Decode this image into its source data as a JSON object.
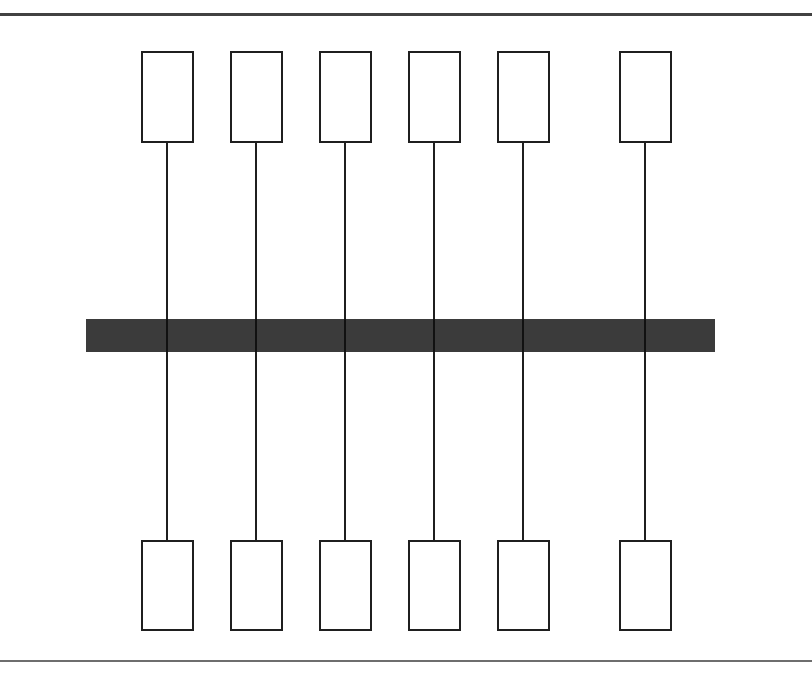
{
  "figure": {
    "title": "",
    "top_text_remnant": "",
    "background_color": "#ffffff"
  },
  "rules": {
    "top": {
      "name": "top-rule",
      "y": 13,
      "height": 3,
      "color": "#414141"
    },
    "bottom": {
      "name": "bottom-rule",
      "y": 660,
      "height": 2,
      "color": "#6e6e6e"
    }
  },
  "chart_data": {
    "type": "diagram",
    "title": "",
    "xlabel": "",
    "ylabel": "",
    "bar": {
      "label": "",
      "x": 86,
      "y": 319,
      "width": 629,
      "height": 33,
      "color": "#3b3b3b"
    },
    "columns": [
      {
        "index": 1,
        "center_x": 167
      },
      {
        "index": 2,
        "center_x": 256
      },
      {
        "index": 3,
        "center_x": 345
      },
      {
        "index": 4,
        "center_x": 434
      },
      {
        "index": 5,
        "center_x": 523
      },
      {
        "index": 6,
        "center_x": 645
      }
    ],
    "top_nodes": [
      {
        "label": "",
        "x": 141,
        "y": 51,
        "width": 53,
        "height": 92
      },
      {
        "label": "",
        "x": 230,
        "y": 51,
        "width": 53,
        "height": 92
      },
      {
        "label": "",
        "x": 319,
        "y": 51,
        "width": 53,
        "height": 92
      },
      {
        "label": "",
        "x": 408,
        "y": 51,
        "width": 53,
        "height": 92
      },
      {
        "label": "",
        "x": 497,
        "y": 51,
        "width": 53,
        "height": 92
      },
      {
        "label": "",
        "x": 619,
        "y": 51,
        "width": 53,
        "height": 92
      }
    ],
    "bottom_nodes": [
      {
        "label": "",
        "x": 141,
        "y": 540,
        "width": 53,
        "height": 91
      },
      {
        "label": "",
        "x": 230,
        "y": 540,
        "width": 53,
        "height": 91
      },
      {
        "label": "",
        "x": 319,
        "y": 540,
        "width": 53,
        "height": 91
      },
      {
        "label": "",
        "x": 408,
        "y": 540,
        "width": 53,
        "height": 91
      },
      {
        "label": "",
        "x": 497,
        "y": 540,
        "width": 53,
        "height": 91
      },
      {
        "label": "",
        "x": 619,
        "y": 540,
        "width": 53,
        "height": 91
      }
    ],
    "connectors": [
      {
        "x": 167,
        "y_start": 143,
        "y_end": 540
      },
      {
        "x": 256,
        "y_start": 143,
        "y_end": 540
      },
      {
        "x": 345,
        "y_start": 143,
        "y_end": 540
      },
      {
        "x": 434,
        "y_start": 143,
        "y_end": 540
      },
      {
        "x": 523,
        "y_start": 143,
        "y_end": 540
      },
      {
        "x": 645,
        "y_start": 143,
        "y_end": 540
      }
    ],
    "colors": {
      "line": "#1f1f1f",
      "bar": "#3b3b3b",
      "rule": "#4a4a4a",
      "background": "#ffffff"
    }
  }
}
